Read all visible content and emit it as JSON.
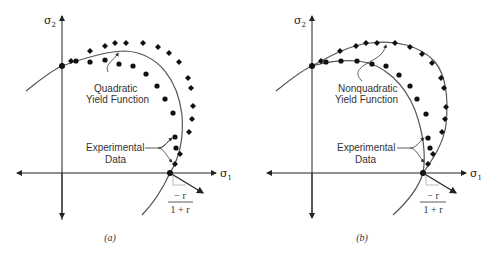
{
  "figure": {
    "panels": [
      {
        "id": "a",
        "caption": "(a)",
        "y_axis_label": "σ",
        "y_axis_sub": "2",
        "x_axis_label": "σ",
        "x_axis_sub": "1",
        "curve_label_line1": "Quadratic",
        "curve_label_line2": "Yield Function",
        "data_label_line1": "Experimental",
        "data_label_line2": "Data",
        "slope_numerator": "− r",
        "slope_denominator": "1 + r"
      },
      {
        "id": "b",
        "caption": "(b)",
        "y_axis_label": "σ",
        "y_axis_sub": "2",
        "x_axis_label": "σ",
        "x_axis_sub": "1",
        "curve_label_line1": "Nonquadratic",
        "curve_label_line2": "Yield Function",
        "data_label_line1": "Experimental",
        "data_label_line2": "Data",
        "slope_numerator": "− r",
        "slope_denominator": "1 + r"
      }
    ],
    "legend": {
      "series": [
        {
          "name": "Experimental data set 1",
          "marker": "circle"
        },
        {
          "name": "Experimental data set 2",
          "marker": "diamond"
        }
      ]
    }
  }
}
